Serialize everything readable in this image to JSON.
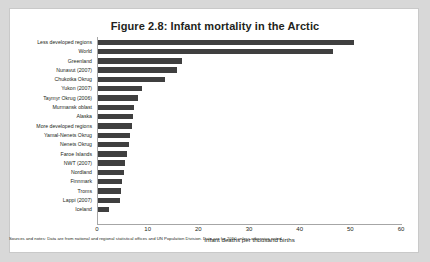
{
  "figure": {
    "title": "Figure 2.8: Infant mortality in the Arctic",
    "footnote": "Sources and notes: Data are from national and regional statistical offices and UN Population Division. Data are for 2010 unless otherwise noted.",
    "bar_color": "#3f3f3f",
    "frame_color": "#a6a6a6",
    "text_color": "#231f20"
  },
  "chart_data": {
    "type": "bar",
    "orientation": "horizontal",
    "title": "Figure 2.8: Infant mortality in the Arctic",
    "xlabel": "Infant deaths per thousand births",
    "ylabel": "",
    "xlim": [
      0,
      60
    ],
    "xticks": [
      0,
      10,
      20,
      30,
      40,
      50,
      60
    ],
    "grid": false,
    "legend": false,
    "categories": [
      "Less developed regions",
      "World",
      "Greenland",
      "Nunavut (2007)",
      "Chukotka Okrug",
      "Yukon (2007)",
      "Taymyr Okrug (2006)",
      "Murmansk oblast",
      "Alaska",
      "More developed regions",
      "Yamal-Nenets Okrug",
      "Nenets Okrug",
      "Faroe Islands",
      "NWT (2007)",
      "Nordland",
      "Finnmark",
      "Troms",
      "Lappi (2007)",
      "Iceland"
    ],
    "values": [
      50.6,
      46.4,
      16.5,
      15.5,
      13.3,
      8.7,
      7.9,
      7.1,
      6.9,
      6.8,
      6.3,
      6.1,
      5.7,
      5.3,
      5.2,
      4.7,
      4.6,
      4.4,
      2.2
    ]
  }
}
